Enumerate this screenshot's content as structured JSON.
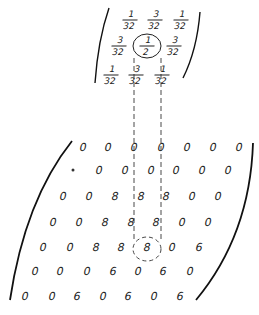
{
  "kernel": {
    "description": "3x3 weighting kernel",
    "rows": [
      [
        {
          "n": "1",
          "d": "32"
        },
        {
          "n": "3",
          "d": "32"
        },
        {
          "n": "1",
          "d": "32"
        }
      ],
      [
        {
          "n": "3",
          "d": "32"
        },
        {
          "n": "1",
          "d": "2"
        },
        {
          "n": "3",
          "d": "32"
        }
      ],
      [
        {
          "n": "1",
          "d": "32"
        },
        {
          "n": "3",
          "d": "32"
        },
        {
          "n": "1",
          "d": "32"
        }
      ]
    ],
    "positions": [
      [
        [
          130,
          20
        ],
        [
          155,
          20
        ],
        [
          181,
          20
        ]
      ],
      [
        [
          119,
          46
        ],
        [
          147,
          46
        ],
        [
          174,
          46
        ]
      ],
      [
        [
          111,
          75
        ],
        [
          136,
          75
        ],
        [
          162,
          75
        ]
      ]
    ],
    "highlighted_cell": [
      1,
      1
    ]
  },
  "grid": {
    "description": "Input value matrix",
    "rows": [
      [
        "0",
        "0",
        "0",
        "0",
        "0",
        "0",
        "0"
      ],
      [
        "•",
        "0",
        "0",
        "0",
        "0",
        "0",
        "0"
      ],
      [
        "0",
        "0",
        "8",
        "8",
        "8",
        "0",
        "0"
      ],
      [
        "0",
        "0",
        "8",
        "8",
        "8",
        "0",
        "0"
      ],
      [
        "0",
        "0",
        "8",
        "8",
        "8",
        "0",
        "6"
      ],
      [
        "0",
        "0",
        "0",
        "6",
        "0",
        "6",
        "0"
      ],
      [
        "0",
        "0",
        "6",
        "0",
        "6",
        "0",
        "6"
      ]
    ],
    "positions": [
      [
        [
          83,
          147
        ],
        [
          108,
          147
        ],
        [
          134,
          147
        ],
        [
          161,
          147
        ],
        [
          187,
          147
        ],
        [
          213,
          147
        ],
        [
          239,
          147
        ]
      ],
      [
        [
          73,
          170
        ],
        [
          99,
          170
        ],
        [
          125,
          170
        ],
        [
          151,
          170
        ],
        [
          176,
          170
        ],
        [
          202,
          170
        ],
        [
          228,
          170
        ]
      ],
      [
        [
          63,
          196
        ],
        [
          89,
          196
        ],
        [
          115,
          196
        ],
        [
          141,
          196
        ],
        [
          166,
          196
        ],
        [
          192,
          196
        ],
        [
          218,
          196
        ]
      ],
      [
        [
          53,
          222
        ],
        [
          79,
          222
        ],
        [
          105,
          222
        ],
        [
          131,
          222
        ],
        [
          156,
          222
        ],
        [
          182,
          222
        ],
        [
          208,
          222
        ]
      ],
      [
        [
          43,
          247
        ],
        [
          70,
          247
        ],
        [
          96,
          247
        ],
        [
          121,
          247
        ],
        [
          147,
          247
        ],
        [
          172,
          247
        ],
        [
          199,
          247
        ]
      ],
      [
        [
          35,
          271
        ],
        [
          60,
          271
        ],
        [
          87,
          271
        ],
        [
          113,
          271
        ],
        [
          138,
          271
        ],
        [
          163,
          271
        ],
        [
          190,
          271
        ]
      ],
      [
        [
          25,
          296
        ],
        [
          52,
          296
        ],
        [
          77,
          296
        ],
        [
          103,
          296
        ],
        [
          128,
          296
        ],
        [
          154,
          296
        ],
        [
          180,
          296
        ]
      ]
    ],
    "highlighted_cell": [
      4,
      4
    ]
  }
}
